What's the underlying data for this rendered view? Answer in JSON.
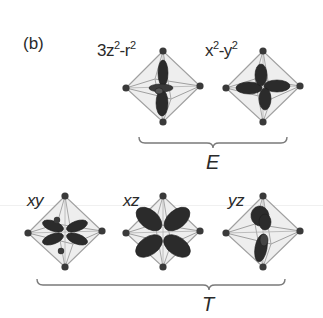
{
  "panel_label": "(b)",
  "groups": [
    {
      "label": "E",
      "orbitals": [
        {
          "id": "3z2-r2",
          "label_parts": [
            "3z",
            "2",
            "-r",
            "2"
          ],
          "lobes": "dz2"
        },
        {
          "id": "x2-y2",
          "label_parts": [
            "x",
            "2",
            "-y",
            "2"
          ],
          "lobes": "dx2y2"
        }
      ]
    },
    {
      "label": "T",
      "orbitals": [
        {
          "id": "xy",
          "label": "xy",
          "lobes": "dxy"
        },
        {
          "id": "xz",
          "label": "xz",
          "lobes": "dxz"
        },
        {
          "id": "yz",
          "label": "yz",
          "lobes": "dyz"
        }
      ]
    }
  ],
  "colors": {
    "text": "#2a2a2a",
    "octahedron_edge": "#9a9a9a",
    "octahedron_fill": "#ececec",
    "vertex": "#3a3a3a",
    "lobe": "#2b2b2b",
    "brace": "#7a7a7a"
  }
}
